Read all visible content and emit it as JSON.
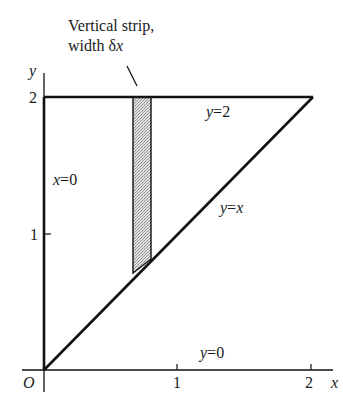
{
  "figure": {
    "annotation": {
      "line1": "Vertical strip,",
      "line2_prefix": "width ",
      "line2_symbol": "δ",
      "line2_var": "x"
    },
    "axes": {
      "x_label": "x",
      "y_label": "y",
      "origin_label": "O",
      "x_ticks": [
        "1",
        "2"
      ],
      "y_ticks": [
        "1",
        "2"
      ]
    },
    "boundary_labels": {
      "top": {
        "var": "y",
        "eq": "=2"
      },
      "diagonal": {
        "var": "y",
        "eq": "=",
        "rhs": "x"
      },
      "left": {
        "var": "x",
        "eq": "=0"
      },
      "bottom": {
        "var": "y",
        "eq": "=0"
      }
    },
    "region": {
      "shape": "triangle",
      "vertices": [
        [
          0,
          0
        ],
        [
          0,
          2
        ],
        [
          2,
          2
        ]
      ]
    },
    "strip": {
      "x_from": 0.67,
      "x_to": 0.8,
      "fill": "#c8c8c8"
    },
    "colors": {
      "stroke": "#111111",
      "text": "#1a1a1a",
      "background": "#ffffff"
    }
  }
}
